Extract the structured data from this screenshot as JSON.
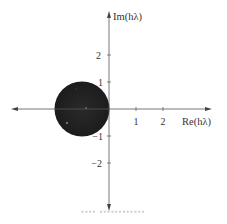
{
  "figure": {
    "x_axis_label": "Re(hλ)",
    "y_axis_label": "Im(hλ)",
    "x_ticks": [
      {
        "value": 1,
        "label": "1"
      },
      {
        "value": 2,
        "label": "2"
      }
    ],
    "y_ticks": [
      {
        "value": 2,
        "label": "2"
      },
      {
        "value": 1,
        "label": "1"
      },
      {
        "value": -1,
        "label": "−1"
      },
      {
        "value": -2,
        "label": "−2"
      }
    ],
    "region": {
      "shape": "disk",
      "center": [
        -1,
        0
      ],
      "radius": 1,
      "fill_color": "#222222"
    },
    "axis_color": "#555555",
    "caption": "▪▪▪▪ ▪▪▪▪▪▪▪▪▪▪▪▪"
  }
}
